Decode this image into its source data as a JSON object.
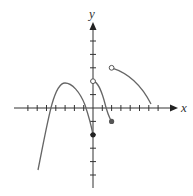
{
  "figure": {
    "type": "piecewise function graph",
    "axes": {
      "x_label": "x",
      "y_label": "y",
      "x_ticks": [
        -8,
        -7,
        -6,
        -5,
        -4,
        -3,
        -2,
        -1,
        1,
        2,
        3,
        4,
        5,
        6,
        7
      ],
      "y_ticks": [
        -6,
        -5,
        -4,
        -3,
        -2,
        -1,
        1,
        2,
        3,
        4,
        5
      ],
      "x_range": [
        -8.5,
        8.5
      ],
      "y_range": [
        -6.5,
        6.5
      ]
    },
    "pieces": [
      {
        "name": "left-cubic-arc",
        "points": [
          [
            -6,
            -4.6
          ],
          [
            -4.8,
            0
          ],
          [
            -3,
            1.8
          ],
          [
            -1,
            0
          ],
          [
            0,
            -2
          ]
        ],
        "start": "none",
        "end": {
          "x": 0,
          "y": -2,
          "type": "closed"
        }
      },
      {
        "name": "middle-arc",
        "points": [
          [
            0,
            2
          ],
          [
            0.6,
            1.5
          ],
          [
            1.5,
            0
          ],
          [
            2,
            -1
          ]
        ],
        "start": {
          "x": 0,
          "y": 2,
          "type": "open"
        },
        "end": {
          "x": 2,
          "y": -1,
          "type": "closed"
        }
      },
      {
        "name": "right-arc",
        "points": [
          [
            2,
            3
          ],
          [
            4,
            2.2
          ],
          [
            6.2,
            0.3
          ]
        ],
        "start": {
          "x": 2,
          "y": 3,
          "type": "open"
        },
        "end": "none"
      }
    ],
    "colors": {
      "axis": "#333333",
      "curve": "#666666"
    }
  }
}
